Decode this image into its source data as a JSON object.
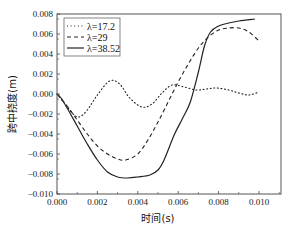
{
  "chart_data": {
    "type": "line",
    "title": "",
    "xlabel": "时间(s)",
    "ylabel": "跨中挠度(m)",
    "xlim": [
      0.0,
      0.011
    ],
    "ylim": [
      -0.01,
      0.008
    ],
    "xticks": [
      "0.000",
      "0.002",
      "0.004",
      "0.006",
      "0.008",
      "0.010"
    ],
    "yticks": [
      "0.008",
      "0.006",
      "0.004",
      "0.002",
      "0.000",
      "-0.002",
      "-0.004",
      "-0.006",
      "-0.008",
      "-0.010"
    ],
    "grid": false,
    "legend_position": "upper-left",
    "series": [
      {
        "name": "λ=17.2",
        "style": "dotted",
        "x": [
          0.0,
          0.0004,
          0.0008,
          0.0011,
          0.0015,
          0.002,
          0.0026,
          0.0031,
          0.0036,
          0.0042,
          0.0047,
          0.0052,
          0.0057,
          0.0063,
          0.0069,
          0.0074,
          0.0079,
          0.0085,
          0.009,
          0.0095,
          0.01
        ],
        "values": [
          0.0,
          -0.001,
          -0.002,
          -0.0023,
          -0.0016,
          -0.0001,
          0.0013,
          0.001,
          -0.0004,
          -0.0013,
          -0.001,
          0.0001,
          0.0009,
          0.0007,
          0.0004,
          0.0005,
          0.0006,
          0.0004,
          0.0001,
          -0.0001,
          0.0002
        ]
      },
      {
        "name": "λ=29",
        "style": "dashed",
        "x": [
          0.0,
          0.0005,
          0.001,
          0.0015,
          0.002,
          0.0025,
          0.003,
          0.0034,
          0.004,
          0.0045,
          0.005,
          0.0055,
          0.006,
          0.0065,
          0.007,
          0.0075,
          0.008,
          0.0085,
          0.009,
          0.0095,
          0.01
        ],
        "values": [
          0.0,
          -0.0012,
          -0.0026,
          -0.004,
          -0.0052,
          -0.006,
          -0.0065,
          -0.0066,
          -0.006,
          -0.0046,
          -0.0028,
          -0.0008,
          0.0012,
          0.003,
          0.0046,
          0.0057,
          0.0064,
          0.0066,
          0.0066,
          0.0062,
          0.0053
        ]
      },
      {
        "name": "λ=38.52",
        "style": "solid",
        "x": [
          0.0,
          0.0002,
          0.0005,
          0.001,
          0.0015,
          0.002,
          0.0025,
          0.003,
          0.0035,
          0.004,
          0.0046,
          0.005,
          0.0053,
          0.0058,
          0.0062,
          0.0066,
          0.007,
          0.0073,
          0.0076,
          0.008,
          0.0085,
          0.009,
          0.0098
        ],
        "values": [
          0.0,
          -0.0004,
          -0.0014,
          -0.0032,
          -0.005,
          -0.0066,
          -0.0078,
          -0.0083,
          -0.0084,
          -0.0083,
          -0.0081,
          -0.0076,
          -0.0066,
          -0.0041,
          -0.0025,
          -0.0008,
          0.0022,
          0.0048,
          0.0062,
          0.0068,
          0.0071,
          0.0073,
          0.0075
        ]
      }
    ]
  },
  "legend": {
    "items": [
      "λ=17.2",
      "λ=29",
      "λ=38.52"
    ]
  },
  "axes": {
    "xlabel": "时间(s)",
    "ylabel": "跨中挠度(m)"
  }
}
